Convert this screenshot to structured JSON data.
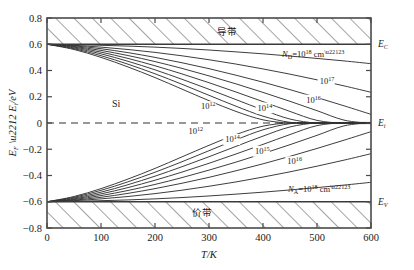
{
  "figure": {
    "material_label": "Si",
    "band_top_label": "导带",
    "band_bottom_label": "价带",
    "xaxis_title_main": "T",
    "xaxis_title_unit": "/K",
    "yaxis_title": "E_F − E_i /eV",
    "edge_labels": {
      "conduction": "E",
      "conduction_sub": "C",
      "intrinsic": "E",
      "intrinsic_sub": "i",
      "valence": "E",
      "valence_sub": "V"
    },
    "donor_label": {
      "symbol": "N",
      "sub": "D",
      "eq": "=10",
      "exp": "18",
      "unit": " cm",
      "unit_exp": "−3"
    },
    "acceptor_label": {
      "symbol": "N",
      "sub": "A",
      "eq": "=10",
      "exp": "18",
      "unit": " cm",
      "unit_exp": "−3"
    },
    "colors": {
      "line": "#333333",
      "frame": "#4a4a4a",
      "hatch": "#4a4a4a",
      "dashed": "#333333",
      "background": "#ffffff"
    }
  },
  "chart_data": {
    "type": "line",
    "title": "",
    "xlabel": "T/K",
    "ylabel": "E_F - E_i /eV",
    "xlim": [
      0,
      600
    ],
    "ylim": [
      -0.8,
      0.8
    ],
    "xticks": [
      0,
      100,
      200,
      300,
      400,
      500,
      600
    ],
    "yticks": [
      -0.8,
      -0.6,
      -0.4,
      -0.2,
      0,
      0.2,
      0.4,
      0.6,
      0.8
    ],
    "xtick_labels": [
      "0",
      "100",
      "200",
      "300",
      "400",
      "500",
      "600"
    ],
    "ytick_labels": [
      "−0.8",
      "−0.6",
      "−0.4",
      "−0.2",
      "0",
      "0.2",
      "0.4",
      "0.6",
      "0.8"
    ],
    "grid": false,
    "legend": "none",
    "band_edges": {
      "conduction_eV": 0.6,
      "valence_eV": -0.6,
      "intrinsic_eV": 0.0
    },
    "hatched_regions": [
      {
        "name": "conduction-band",
        "from_eV": 0.6,
        "to_eV": 0.8
      },
      {
        "name": "valence-band",
        "from_eV": -0.8,
        "to_eV": -0.6
      }
    ],
    "annotations": [
      {
        "text": "Si",
        "x": 120,
        "y": 0.27
      },
      {
        "text": "导带",
        "x": 330,
        "y": 0.72
      },
      {
        "text": "价带",
        "x": 295,
        "y": -0.72
      },
      {
        "text": "N_D=10^18 cm^-3",
        "x": 430,
        "y": 0.535
      },
      {
        "text": "N_A=10^18 cm^-3",
        "x": 440,
        "y": -0.545
      }
    ],
    "series": [
      {
        "name": "ND=1e18",
        "type": "donor",
        "label": "N_D=10^18 cm^-3",
        "label_x": 430,
        "label_y": 0.535,
        "x": [
          0,
          50,
          100,
          150,
          200,
          250,
          300,
          350,
          400,
          450,
          500,
          550,
          600
        ],
        "values": [
          0.6,
          0.597,
          0.592,
          0.586,
          0.578,
          0.568,
          0.556,
          0.542,
          0.527,
          0.51,
          0.492,
          0.473,
          0.452
        ]
      },
      {
        "name": "1e17",
        "type": "donor",
        "label": "10^17",
        "label_x": 505,
        "label_y": 0.295,
        "x": [
          0,
          50,
          100,
          150,
          200,
          250,
          300,
          350,
          400,
          450,
          500,
          550,
          600
        ],
        "values": [
          0.6,
          0.592,
          0.578,
          0.56,
          0.538,
          0.512,
          0.482,
          0.449,
          0.412,
          0.372,
          0.329,
          0.283,
          0.234
        ]
      },
      {
        "name": "1e16",
        "type": "donor",
        "label": "10^16",
        "label_x": 480,
        "label_y": 0.155,
        "x": [
          0,
          50,
          100,
          150,
          200,
          250,
          300,
          350,
          400,
          450,
          500,
          550,
          600
        ],
        "values": [
          0.6,
          0.588,
          0.566,
          0.536,
          0.5,
          0.459,
          0.414,
          0.364,
          0.311,
          0.254,
          0.194,
          0.131,
          0.066
        ]
      },
      {
        "name": "1e15",
        "type": "donor",
        "label": "10^15",
        "x": [
          0,
          50,
          100,
          150,
          200,
          250,
          300,
          350,
          400,
          450,
          500,
          550,
          600
        ],
        "values": [
          0.6,
          0.583,
          0.553,
          0.514,
          0.468,
          0.416,
          0.359,
          0.298,
          0.233,
          0.165,
          0.094,
          0.022,
          -0.004
        ]
      },
      {
        "name": "1e14",
        "type": "donor",
        "label": "10^14",
        "label_x": 390,
        "label_y": 0.095,
        "x": [
          0,
          50,
          100,
          150,
          200,
          250,
          300,
          350,
          400,
          450,
          500,
          550,
          600
        ],
        "values": [
          0.6,
          0.578,
          0.54,
          0.492,
          0.436,
          0.374,
          0.307,
          0.236,
          0.163,
          0.088,
          0.02,
          -0.002,
          -0.004
        ]
      },
      {
        "name": "1e13",
        "type": "donor",
        "label": "10^13",
        "x": [
          0,
          50,
          100,
          150,
          200,
          250,
          300,
          350,
          400,
          450,
          500,
          550,
          600
        ],
        "values": [
          0.6,
          0.572,
          0.527,
          0.47,
          0.405,
          0.333,
          0.257,
          0.178,
          0.1,
          0.03,
          -0.001,
          -0.003,
          -0.004
        ]
      },
      {
        "name": "1e12",
        "type": "donor",
        "label": "10^12",
        "label_x": 285,
        "label_y": 0.105,
        "x": [
          0,
          50,
          100,
          150,
          200,
          250,
          300,
          350,
          400,
          450,
          500,
          550,
          600
        ],
        "values": [
          0.6,
          0.566,
          0.513,
          0.448,
          0.375,
          0.295,
          0.211,
          0.128,
          0.052,
          0.005,
          -0.002,
          -0.003,
          -0.004
        ]
      },
      {
        "name": "1e11",
        "type": "donor",
        "label": "",
        "x": [
          0,
          50,
          100,
          150,
          200,
          250,
          300,
          350,
          400,
          450,
          500,
          550,
          600
        ],
        "values": [
          0.6,
          0.56,
          0.5,
          0.427,
          0.346,
          0.258,
          0.17,
          0.088,
          0.024,
          -0.001,
          -0.003,
          -0.004,
          -0.004
        ]
      },
      {
        "name": "NA=1e18",
        "type": "acceptor",
        "label": "N_A=10^18 cm^-3",
        "label_x": 440,
        "label_y": -0.545,
        "x": [
          0,
          50,
          100,
          150,
          200,
          250,
          300,
          350,
          400,
          450,
          500,
          550,
          600
        ],
        "values": [
          -0.6,
          -0.597,
          -0.592,
          -0.586,
          -0.578,
          -0.568,
          -0.556,
          -0.542,
          -0.527,
          -0.51,
          -0.492,
          -0.473,
          -0.452
        ]
      },
      {
        "name": "1e17a",
        "type": "acceptor",
        "label": "10^16",
        "label_x": 445,
        "label_y": -0.315,
        "x": [
          0,
          50,
          100,
          150,
          200,
          250,
          300,
          350,
          400,
          450,
          500,
          550,
          600
        ],
        "values": [
          -0.6,
          -0.592,
          -0.578,
          -0.56,
          -0.538,
          -0.512,
          -0.482,
          -0.449,
          -0.412,
          -0.372,
          -0.329,
          -0.283,
          -0.234
        ]
      },
      {
        "name": "1e16a",
        "type": "acceptor",
        "label": "10^15",
        "label_x": 385,
        "label_y": -0.235,
        "x": [
          0,
          50,
          100,
          150,
          200,
          250,
          300,
          350,
          400,
          450,
          500,
          550,
          600
        ],
        "values": [
          -0.6,
          -0.588,
          -0.566,
          -0.536,
          -0.5,
          -0.459,
          -0.414,
          -0.364,
          -0.311,
          -0.254,
          -0.194,
          -0.131,
          -0.066
        ]
      },
      {
        "name": "1e15a",
        "type": "acceptor",
        "label": "",
        "x": [
          0,
          50,
          100,
          150,
          200,
          250,
          300,
          350,
          400,
          450,
          500,
          550,
          600
        ],
        "values": [
          -0.6,
          -0.583,
          -0.553,
          -0.514,
          -0.468,
          -0.416,
          -0.359,
          -0.298,
          -0.233,
          -0.165,
          -0.094,
          -0.022,
          0.004
        ]
      },
      {
        "name": "1e14a",
        "type": "acceptor",
        "label": "10^14",
        "label_x": 330,
        "label_y": -0.145,
        "x": [
          0,
          50,
          100,
          150,
          200,
          250,
          300,
          350,
          400,
          450,
          500,
          550,
          600
        ],
        "values": [
          -0.6,
          -0.578,
          -0.54,
          -0.492,
          -0.436,
          -0.374,
          -0.307,
          -0.236,
          -0.163,
          -0.088,
          -0.02,
          0.002,
          0.004
        ]
      },
      {
        "name": "1e13a",
        "type": "acceptor",
        "label": "",
        "x": [
          0,
          50,
          100,
          150,
          200,
          250,
          300,
          350,
          400,
          450,
          500,
          550,
          600
        ],
        "values": [
          -0.6,
          -0.572,
          -0.527,
          -0.47,
          -0.405,
          -0.333,
          -0.257,
          -0.178,
          -0.1,
          -0.03,
          0.001,
          0.003,
          0.004
        ]
      },
      {
        "name": "1e12a",
        "type": "acceptor",
        "label": "10^12",
        "label_x": 262,
        "label_y": -0.085,
        "x": [
          0,
          50,
          100,
          150,
          200,
          250,
          300,
          350,
          400,
          450,
          500,
          550,
          600
        ],
        "values": [
          -0.6,
          -0.566,
          -0.513,
          -0.448,
          -0.375,
          -0.295,
          -0.211,
          -0.128,
          -0.052,
          -0.005,
          0.002,
          0.003,
          0.004
        ]
      },
      {
        "name": "1e11a",
        "type": "acceptor",
        "label": "",
        "x": [
          0,
          50,
          100,
          150,
          200,
          250,
          300,
          350,
          400,
          450,
          500,
          550,
          600
        ],
        "values": [
          -0.6,
          -0.56,
          -0.5,
          -0.427,
          -0.346,
          -0.258,
          -0.17,
          -0.088,
          -0.024,
          0.001,
          0.003,
          0.004,
          0.004
        ]
      }
    ]
  }
}
